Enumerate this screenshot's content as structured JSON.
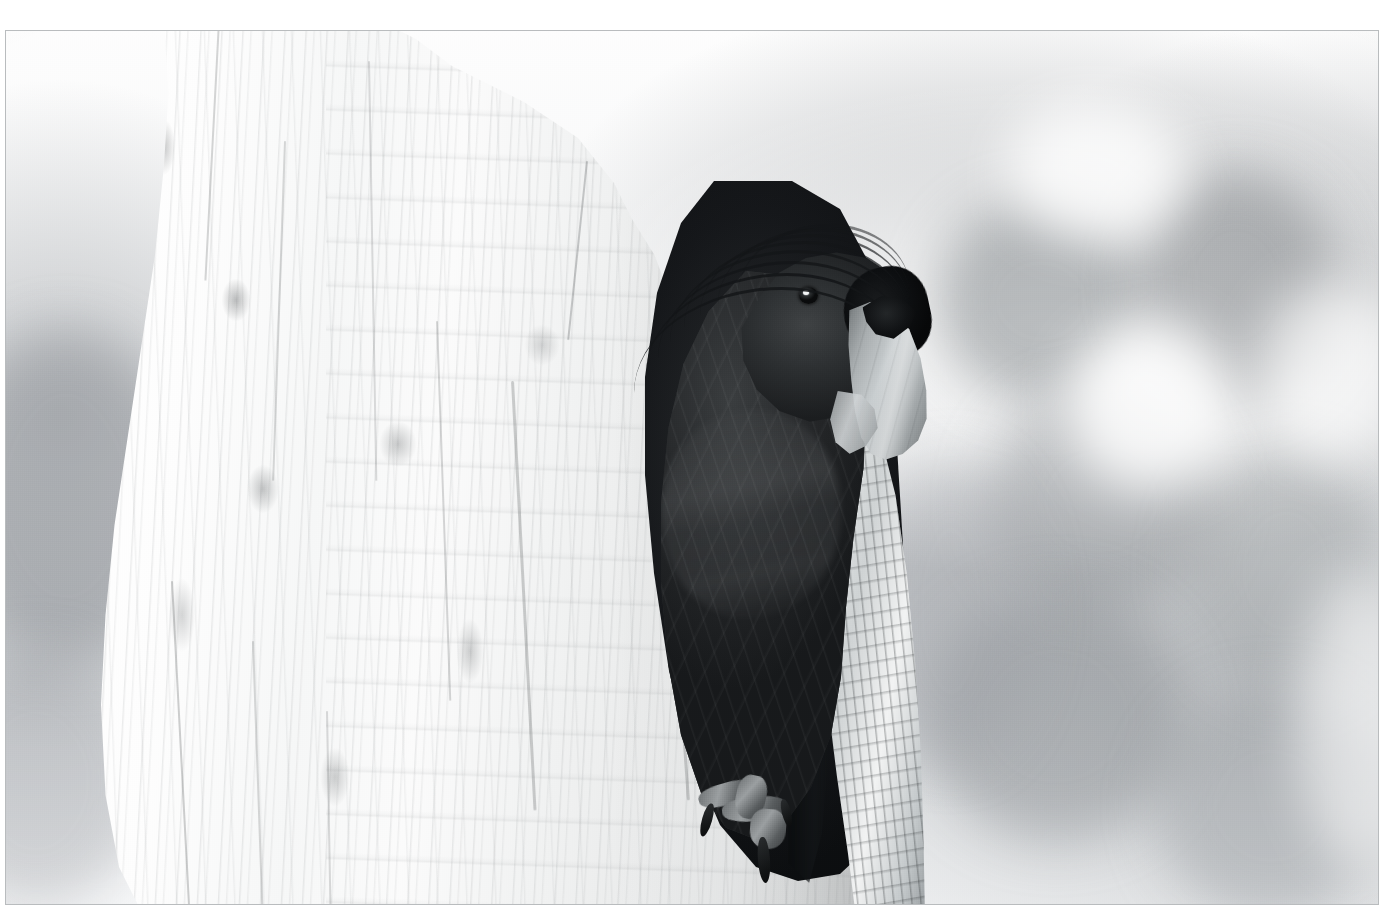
{
  "page": {
    "width": 1399,
    "height": 915,
    "background_color": "#ffffff"
  },
  "frame": {
    "name": "photo-border",
    "left": 5,
    "top": 30,
    "width": 1374,
    "height": 875,
    "border_color": "#b9bcbe",
    "border_width_px": 1
  },
  "photo": {
    "title": "Palm cockatoo at tree hollow",
    "medium": "black-and-white photograph",
    "orientation": "landscape",
    "caption": "",
    "tonality": {
      "key": "high-key",
      "darkest_value": "#0c0e10",
      "lightest_value": "#ffffff",
      "midtone_value": "#9aa0a3"
    },
    "palette": {
      "paper_white": "#ffffff",
      "trunk_highlight": "#fdfdfd",
      "trunk_midtone": "#e8eaea",
      "bark_shadow": "#8d9295",
      "background_grey": "#9aa0a3",
      "plumage_dark": "#212426",
      "plumage_black": "#0d0f11",
      "beak_pale": "#c8cdcf",
      "hollow_black": "#15171a"
    },
    "subjects": [
      {
        "name": "tree-trunk",
        "description": "Large pale bleached eucalyptus trunk filling the left two-thirds of the frame, with fine vertical grain striations, faint horizontal ring bands and dark lichen speckles."
      },
      {
        "name": "tree-hollow",
        "description": "Dark vertical nest cavity in the right side of the trunk with a ragged splintered pale bark rim."
      },
      {
        "name": "cockatoo",
        "description": "Dark palm cockatoo perched in the hollow entrance, facing right.",
        "parts": [
          {
            "name": "crest",
            "description": "Long recurved black crest feathers sweeping back over the trunk"
          },
          {
            "name": "head",
            "description": "Dark rounded head with pale eye-ring catchlight"
          },
          {
            "name": "eye",
            "description": "Small dark eye with a bright specular catchlight"
          },
          {
            "name": "cheek-patch",
            "description": "Black bare facial patch behind the beak"
          },
          {
            "name": "beak",
            "description": "Very large pale curved bill with a dark hooked upper tip"
          },
          {
            "name": "breast",
            "description": "Dark sooty breast with soft horizontal feather banding"
          },
          {
            "name": "foot",
            "description": "Zygodactyl grey foot with dark claws gripping the lower rim of the hollow"
          }
        ]
      },
      {
        "name": "background",
        "description": "Heavily blurred high-key foliage bokeh — soft grey blobs on near-white, at the right edge and far left edge of the frame."
      }
    ],
    "composition": {
      "trunk_region": "x 0-860",
      "hollow_region": "x 612-912, y 150-850",
      "bird_region": "x 640-930, y 200-860",
      "background_region": "right of x 900 and left of x 170"
    }
  }
}
